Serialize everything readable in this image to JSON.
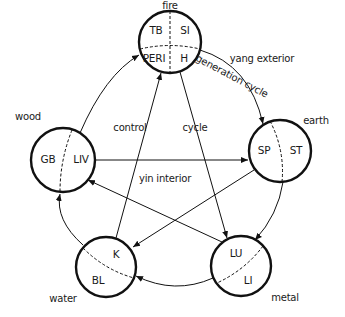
{
  "diagram": {
    "colors": {
      "stroke": "#111111",
      "background": "#ffffff",
      "text": "#1a1a1a"
    },
    "regions": {
      "outer": "yang exterior",
      "inner": "yin interior"
    },
    "cycles": {
      "generation": "generation cycle",
      "control_word1": "control",
      "control_word2": "cycle"
    },
    "elements": [
      {
        "id": "fire",
        "label": "fire",
        "organs": [
          "TB",
          "SI",
          "PERI",
          "H"
        ],
        "cx": 170,
        "cy": 42,
        "r": 31
      },
      {
        "id": "earth",
        "label": "earth",
        "organs": [
          "SP",
          "ST"
        ],
        "cx": 280,
        "cy": 151,
        "r": 31
      },
      {
        "id": "metal",
        "label": "metal",
        "organs": [
          "LU",
          "LI"
        ],
        "cx": 241,
        "cy": 266,
        "r": 30
      },
      {
        "id": "water",
        "label": "water",
        "organs": [
          "K",
          "BL"
        ],
        "cx": 106,
        "cy": 267,
        "r": 30
      },
      {
        "id": "wood",
        "label": "wood",
        "organs": [
          "GB",
          "LIV"
        ],
        "cx": 63,
        "cy": 160,
        "r": 32
      }
    ]
  }
}
